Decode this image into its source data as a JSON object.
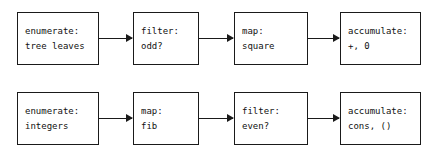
{
  "diagram": {
    "type": "signal-flow-diagram",
    "background_color": "#ffffff",
    "line_color": "#1a1a1a",
    "text_color": "#111111",
    "rows": [
      {
        "name": "sum-of-squares-of-odd-leaves",
        "stages": [
          {
            "name": "enumerate",
            "line1": "enumerate:",
            "line2": "tree leaves"
          },
          {
            "name": "filter",
            "line1": "filter:",
            "line2": "odd?"
          },
          {
            "name": "map",
            "line1": "map:",
            "line2": "square"
          },
          {
            "name": "accumulate",
            "line1": "accumulate:",
            "line2": "+, 0"
          }
        ],
        "connectors": [
          "arrow-right",
          "arrow-right",
          "arrow-right"
        ]
      },
      {
        "name": "list-of-even-fibs",
        "stages": [
          {
            "name": "enumerate",
            "line1": "enumerate:",
            "line2": "integers"
          },
          {
            "name": "map",
            "line1": "map:",
            "line2": "fib"
          },
          {
            "name": "filter",
            "line1": "filter:",
            "line2": "even?"
          },
          {
            "name": "accumulate",
            "line1": "accumulate:",
            "line2": "cons, ()"
          }
        ],
        "connectors": [
          "arrow-right",
          "arrow-right",
          "arrow-right"
        ]
      }
    ]
  }
}
